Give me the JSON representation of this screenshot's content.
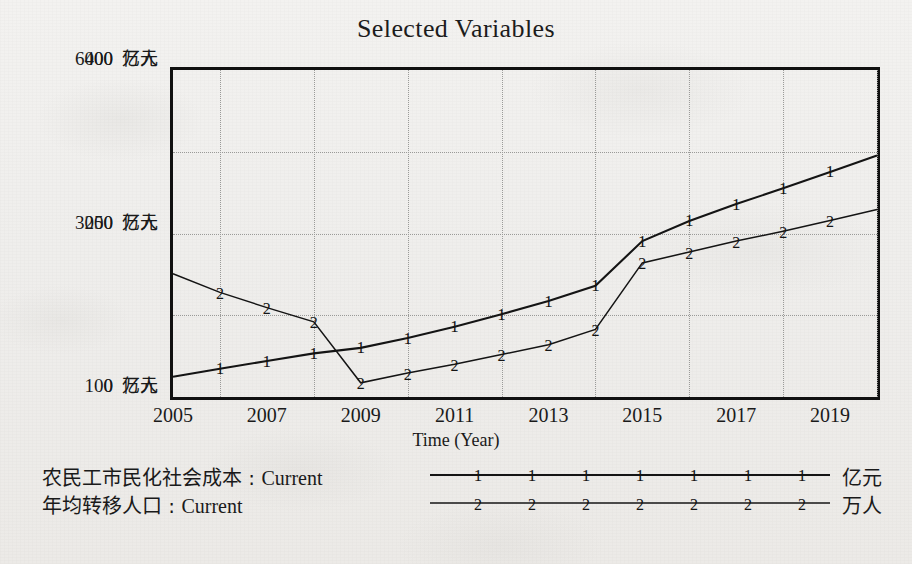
{
  "chart_data": {
    "type": "line",
    "title": "Selected Variables",
    "xlabel": "Time (Year)",
    "ylabel": "",
    "grid": true,
    "legend_position": "below",
    "x": [
      2005,
      2006,
      2007,
      2008,
      2009,
      2010,
      2011,
      2012,
      2013,
      2014,
      2015,
      2016,
      2017,
      2018,
      2019,
      2020
    ],
    "xtick_labels": [
      "2005",
      "2007",
      "2009",
      "2011",
      "2013",
      "2015",
      "2017",
      "2019"
    ],
    "xlim": [
      2005,
      2020
    ],
    "axes": [
      {
        "id": "left",
        "unit": "亿元",
        "ticks": [
          "0",
          "3000",
          "6000"
        ],
        "lim": [
          0,
          6000
        ]
      },
      {
        "id": "right",
        "unit": "万人",
        "ticks": [
          "100",
          "250",
          "400"
        ],
        "lim": [
          100,
          400
        ]
      }
    ],
    "ytick_rows": [
      {
        "left": "6000",
        "left_unit": "亿元",
        "right": "400",
        "right_unit": "万人"
      },
      {
        "left": "3000",
        "left_unit": "亿元",
        "right": "250",
        "right_unit": "万人"
      },
      {
        "left": "0",
        "left_unit": "亿元",
        "right": "100",
        "right_unit": "万人"
      }
    ],
    "series": [
      {
        "name": "农民工市民化社会成本 : Current",
        "label_cn": "农民工市民化社会成本",
        "scenario": "Current",
        "marker": "1",
        "unit": "亿元",
        "axis": "left",
        "values": [
          370,
          520,
          660,
          800,
          900,
          1080,
          1290,
          1520,
          1760,
          2040,
          2860,
          3230,
          3540,
          3830,
          4130,
          4430
        ]
      },
      {
        "name": "年均转移人口 : Current",
        "label_cn": "年均转移人口",
        "scenario": "Current",
        "marker": "2",
        "unit": "万人",
        "axis": "right",
        "values": [
          213,
          196,
          182,
          169,
          113,
          122,
          130,
          139,
          148,
          162,
          223,
          233,
          243,
          252,
          262,
          272
        ]
      }
    ]
  },
  "legend": {
    "rows": [
      {
        "label": "农民工市民化社会成本 : Current",
        "marker": "1",
        "unit": "亿元",
        "marker_count": 7
      },
      {
        "label": "年均转移人口 : Current",
        "marker": "2",
        "unit": "万人",
        "marker_count": 7
      }
    ]
  }
}
